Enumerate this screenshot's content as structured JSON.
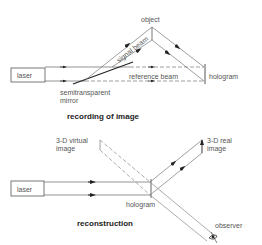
{
  "diagram": {
    "type": "holography-schematic",
    "panels": [
      {
        "id": "recording",
        "caption": "recording of image",
        "labels": {
          "laser": "laser",
          "object": "object",
          "signal_beam": "signal beam",
          "reference_beam": "reference beam",
          "hologram": "hologram",
          "mirror_line1": "semitransparent",
          "mirror_line2": "mirror"
        }
      },
      {
        "id": "reconstruction",
        "caption": "reconstruction",
        "labels": {
          "laser": "laser",
          "virtual_line1": "3-D virtual",
          "virtual_line2": "image",
          "real_line1": "3-D real",
          "real_line2": "image",
          "hologram": "hologram",
          "observer": "observer"
        }
      }
    ]
  }
}
